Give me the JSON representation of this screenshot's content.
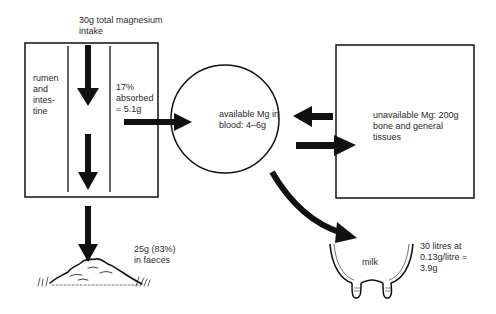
{
  "diagram": {
    "intake_label": "30g total magnesium intake",
    "intake_line1": "30g total magnesium",
    "intake_line2": "intake",
    "rumen_label_lines": [
      "rumen",
      "and",
      "intes-",
      "tine"
    ],
    "absorbed_lines": [
      "17%",
      "absorbed",
      "= 5.1g"
    ],
    "blood_lines": [
      "available Mg in",
      "blood: 4–6g"
    ],
    "unavailable_lines": [
      "unavailable Mg: 200g",
      "bone and general",
      "tissues"
    ],
    "faeces_lines": [
      "25g (83%)",
      "in faeces"
    ],
    "milk_label": "milk",
    "milk_lines": [
      "30 litres at",
      "0.13g/litre =",
      "3.9g"
    ]
  },
  "colors": {
    "ink": "#111111",
    "paper": "#ffffff",
    "text": "#2a2a2a"
  }
}
